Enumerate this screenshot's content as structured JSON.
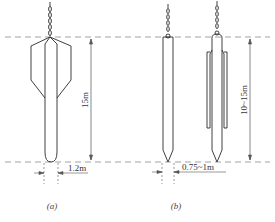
{
  "figure": {
    "panels": [
      {
        "id": "a",
        "caption": "(a)",
        "height_label": "15m",
        "width_label": "1.2m"
      },
      {
        "id": "b",
        "caption": "(b)",
        "height_label": "10~15m",
        "width_label": "0.75~1m"
      }
    ],
    "colors": {
      "line": "#2a2a2a",
      "dashed": "#8a8a8a",
      "dimension": "#555555"
    }
  }
}
